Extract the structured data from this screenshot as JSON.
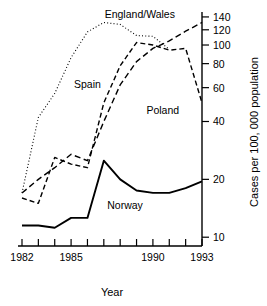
{
  "chart_data": {
    "type": "line",
    "title": "",
    "xlabel": "Year",
    "ylabel": "Cases per 100, 000 population",
    "x": [
      1982,
      1983,
      1984,
      1985,
      1986,
      1987,
      1988,
      1989,
      1990,
      1991,
      1992,
      1993
    ],
    "xlim": [
      1982,
      1993
    ],
    "ylim": [
      9,
      145
    ],
    "yscale": "log",
    "yticks": [
      10,
      20,
      40,
      60,
      80,
      100,
      120,
      140
    ],
    "ytick_labels": [
      "10",
      "20",
      "40",
      "60",
      "80",
      "100",
      "120",
      "140"
    ],
    "xticks": [
      1982,
      1983,
      1984,
      1985,
      1986,
      1987,
      1988,
      1989,
      1990,
      1991,
      1992,
      1993
    ],
    "xtick_labels": [
      "1982",
      "",
      "",
      "1985",
      "",
      "",
      "",
      "",
      "1990",
      "",
      "",
      "1993"
    ],
    "grid": false,
    "legend": "inline-labels",
    "series": [
      {
        "name": "Spain",
        "style": "dotted",
        "label_x": 1986.0,
        "label_y": 60,
        "x": [
          1982,
          1983,
          1984,
          1985,
          1986,
          1987,
          1988,
          1989,
          1990,
          1991
        ],
        "values": [
          17,
          42,
          56,
          86,
          117,
          131,
          128,
          112,
          111,
          95
        ]
      },
      {
        "name": "Poland",
        "style": "dashed",
        "label_x": 1990.6,
        "label_y": 44,
        "x": [
          1982,
          1983,
          1984,
          1985,
          1986,
          1987,
          1988,
          1989,
          1990,
          1991,
          1992,
          1993
        ],
        "values": [
          16,
          15,
          26,
          24,
          23,
          50,
          78,
          103,
          100,
          94,
          96,
          50
        ]
      },
      {
        "name": "England/Wales",
        "style": "longdash",
        "label_x": 1989.2,
        "label_y": 138,
        "x": [
          1982,
          1983,
          1984,
          1985,
          1986,
          1987,
          1988,
          1989,
          1990,
          1991,
          1992,
          1993
        ],
        "values": [
          17,
          20,
          23,
          27,
          25,
          40,
          62,
          82,
          96,
          105,
          118,
          131
        ]
      },
      {
        "name": "Norway",
        "style": "solid",
        "label_x": 1988.3,
        "label_y": 14,
        "x": [
          1982,
          1983,
          1984,
          1985,
          1986,
          1987,
          1988,
          1989,
          1990,
          1991,
          1992,
          1993
        ],
        "values": [
          11.5,
          11.5,
          11.2,
          12.6,
          12.6,
          25,
          20,
          17.5,
          17,
          17,
          18,
          19.5
        ]
      }
    ]
  }
}
